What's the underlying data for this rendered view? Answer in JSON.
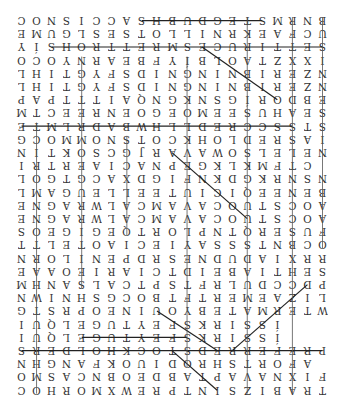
{
  "puzzle": {
    "orientation": "rotated 180 degrees",
    "columns": 21,
    "rows": 29,
    "grid_visual_rows": [
      "CONSICCASHBUDGETSMRNB",
      "EMUGLSESTOLLINRKEAFCU",
      "YÍSHORTTERMSECURITTES",
      "OCOYNRAEBFYÍBLOATZXXI",
      "LHITGYFSDINGNINBIREZN",
      "PAPTTTIAQNGKNSGÍRODBE",
      "MTCEERNEOGEOMEESUHAES",
      "ETMLRDABWHLLDERCCSSTS",
      "GCOMMONSTOCKHOLDERSAI",
      "NITKOSCGJRAVAWOSLELEN",
      "IRTREAICANPEGKLKMFTC",
      "LOGTGCAXDGIFNKDGKRNSNU",
      "LMAGUELLEETUICIQEENEB",
      "ENGARWLACMAVACOUTSCOA",
      "SOEGIGEQTROLPNTQRESUF",
      "TTLETOAICEIYASSSTNBCO",
      "NROLINEPDRSENDUDAIXRR",
      "EAAOEIRAICTDIEBAITHES",
      "MHNASLACTPSTFRLUDCCDP",
      "NWINHSGCOBTFTREMEAZIL",
      "GTSRPOENIUOYBETAMRETW",
      "IUQLEGUTYEFSKRISSÍ",
      "SREDLOHKCOTSDERREFERP",
      "NHGNAFKOUIDORHSTROFA",
      "OMSACNBOEDBATPAVANXIFC",
      "COHROMXWERPTNISZIBART"
    ],
    "found_lines": [
      {
        "word": "horizontal-row1",
        "from": [
          8,
          0
        ],
        "to": [
          16,
          0
        ]
      },
      {
        "word": "horizontal-row3",
        "from": [
          2,
          2
        ],
        "to": [
          20,
          2
        ]
      },
      {
        "word": "horizontal-row9",
        "from": [
          0,
          8
        ],
        "to": [
          18,
          8
        ]
      },
      {
        "word": "horizontal-row25",
        "from": [
          4,
          24
        ],
        "to": [
          11,
          24
        ]
      },
      {
        "word": "horizontal-row26",
        "from": [
          0,
          25
        ],
        "to": [
          20,
          25
        ]
      },
      {
        "word": "diagonal-upper",
        "from": [
          12,
          2
        ],
        "to": [
          17,
          6
        ]
      },
      {
        "word": "diagonal-middle",
        "from": [
          10,
          10
        ],
        "to": [
          15,
          15
        ]
      },
      {
        "word": "diagonal-lower-1",
        "from": [
          9,
          22
        ],
        "to": [
          13,
          25
        ]
      },
      {
        "word": "diagonal-lower-2",
        "from": [
          10,
          25
        ],
        "to": [
          13,
          28
        ]
      },
      {
        "word": "diagonal-lower-3",
        "from": [
          14,
          25
        ],
        "to": [
          19,
          20
        ]
      }
    ]
  },
  "colors": {
    "letters": "#333333",
    "lines": "#222222",
    "background": "#ffffff"
  }
}
